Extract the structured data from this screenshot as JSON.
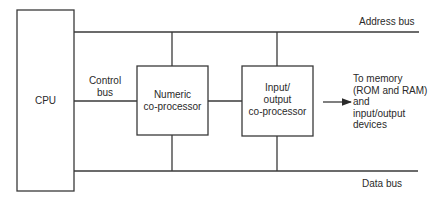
{
  "diagram": {
    "type": "block-diagram",
    "title": "",
    "nodes": {
      "cpu": {
        "label": "CPU"
      },
      "numeric": {
        "label_lines": [
          "Numeric",
          "co-processor"
        ]
      },
      "io": {
        "label_lines": [
          "Input/",
          "output",
          "co-processor"
        ]
      }
    },
    "buses": {
      "address": {
        "label": "Address bus"
      },
      "data": {
        "label": "Data bus"
      },
      "control": {
        "label_lines": [
          "Control",
          "bus"
        ]
      }
    },
    "output_note": {
      "lines": [
        "To memory",
        "(ROM and RAM)",
        "and",
        "input/output",
        "devices"
      ]
    },
    "edges": [
      {
        "from": "cpu",
        "to": "address-bus"
      },
      {
        "from": "cpu",
        "to": "data-bus"
      },
      {
        "from": "cpu",
        "to": "numeric",
        "via": "control-bus"
      },
      {
        "from": "numeric",
        "to": "io",
        "via": "control-bus"
      },
      {
        "from": "numeric",
        "to": "address-bus"
      },
      {
        "from": "numeric",
        "to": "data-bus"
      },
      {
        "from": "io",
        "to": "address-bus"
      },
      {
        "from": "io",
        "to": "data-bus"
      },
      {
        "from": "io",
        "to": "output_note",
        "arrow": true
      }
    ],
    "colors": {
      "stroke": "#3a3a3a",
      "text": "#2a2a2a",
      "background": "#ffffff"
    }
  }
}
